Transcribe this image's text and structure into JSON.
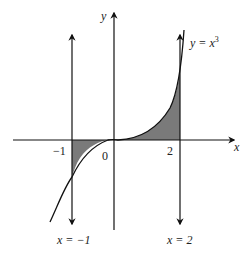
{
  "diagram": {
    "type": "area-under-curve",
    "function": "y = x^3",
    "curve_label_prefix": "y = x",
    "curve_label_exp": "3",
    "axis_x_label": "x",
    "axis_y_label": "y",
    "tick_labels": {
      "minus_one": "−1",
      "zero": "0",
      "two": "2"
    },
    "vertical_lines": [
      {
        "label": "x = −1",
        "x_value": -1
      },
      {
        "label": "x = 2",
        "x_value": 2
      }
    ],
    "shaded_regions": [
      {
        "from": -1,
        "to": 0,
        "side": "below x-axis"
      },
      {
        "from": 0,
        "to": 2,
        "side": "above x-axis"
      }
    ],
    "colors": {
      "stroke": "#111111",
      "shade": "#7a7a7a",
      "background": "#ffffff"
    }
  }
}
